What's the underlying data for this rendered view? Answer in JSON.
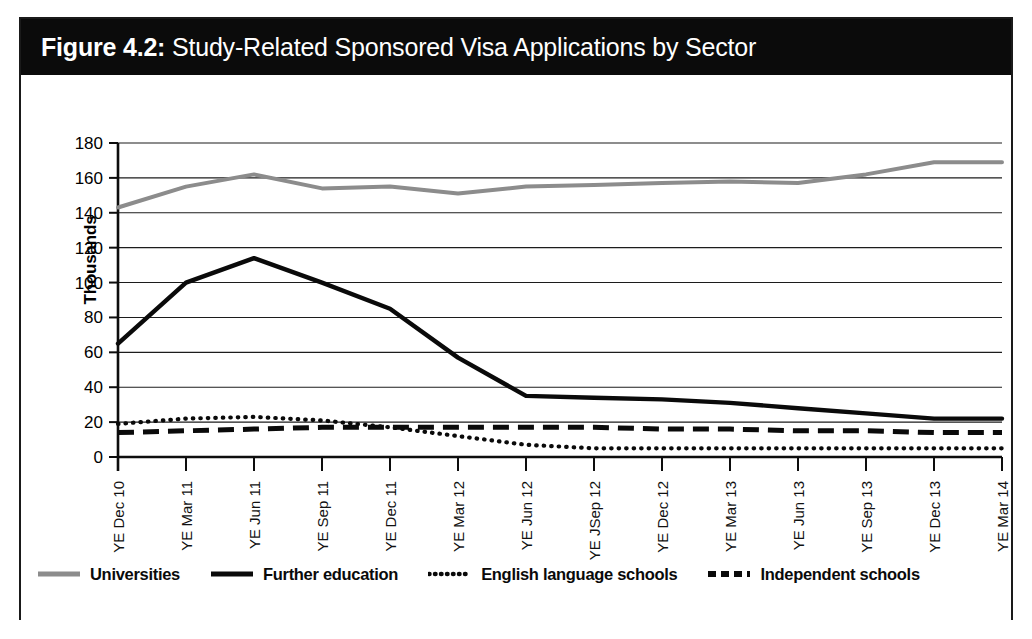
{
  "figure": {
    "number": "Figure 4.2:",
    "title": "Study-Related Sponsored Visa Applications by Sector"
  },
  "colors": {
    "title_bar_bg": "#0b0b0b",
    "title_text": "#ffffff",
    "frame_border": "#1a1a1a",
    "universities": "#8c8c8c",
    "further_education": "#0a0a0a",
    "english_language_schools": "#0a0a0a",
    "independent_schools": "#0a0a0a",
    "gridline": "#1c1c1c",
    "plot_background": "#ffffff"
  },
  "chart_data": {
    "type": "line",
    "title": "Study-Related Sponsored Visa Applications by Sector",
    "xlabel": "",
    "ylabel": "Thousands",
    "ylim": [
      0,
      180
    ],
    "ytick_step": 20,
    "yticks": [
      0,
      20,
      40,
      60,
      80,
      100,
      120,
      140,
      160,
      180
    ],
    "grid": true,
    "legend_position": "bottom",
    "categories": [
      "YE Dec 10",
      "YE Mar 11",
      "YE Jun 11",
      "YE Sep 11",
      "YE Dec 11",
      "YE Mar 12",
      "YE Jun 12",
      "YE JSep 12",
      "YE Dec 12",
      "YE Mar 13",
      "YE Jun 13",
      "YE Sep 13",
      "YE Dec 13",
      "YE Mar 14"
    ],
    "series": [
      {
        "name": "Universities",
        "style": "solid",
        "color": "#8c8c8c",
        "values": [
          143,
          155,
          162,
          154,
          155,
          151,
          155,
          156,
          157,
          158,
          157,
          162,
          169,
          169
        ]
      },
      {
        "name": "Further education",
        "style": "solid",
        "color": "#0a0a0a",
        "values": [
          65,
          100,
          114,
          100,
          85,
          57,
          35,
          34,
          33,
          31,
          28,
          25,
          22,
          22
        ]
      },
      {
        "name": "English language schools",
        "style": "dotted",
        "color": "#0a0a0a",
        "values": [
          19,
          22,
          23,
          21,
          17,
          12,
          7,
          5,
          5,
          5,
          5,
          5,
          5,
          5
        ]
      },
      {
        "name": "Independent schools",
        "style": "dashed",
        "color": "#0a0a0a",
        "values": [
          14,
          15,
          16,
          17,
          17,
          17,
          17,
          17,
          16,
          16,
          15,
          15,
          14,
          14
        ]
      }
    ]
  },
  "legend": {
    "items": [
      {
        "label": "Universities",
        "style": "solid",
        "color": "#8c8c8c"
      },
      {
        "label": "Further education",
        "style": "solid",
        "color": "#0a0a0a"
      },
      {
        "label": "English language schools",
        "style": "dotted",
        "color": "#0a0a0a"
      },
      {
        "label": "Independent schools",
        "style": "dashed",
        "color": "#0a0a0a"
      }
    ]
  }
}
